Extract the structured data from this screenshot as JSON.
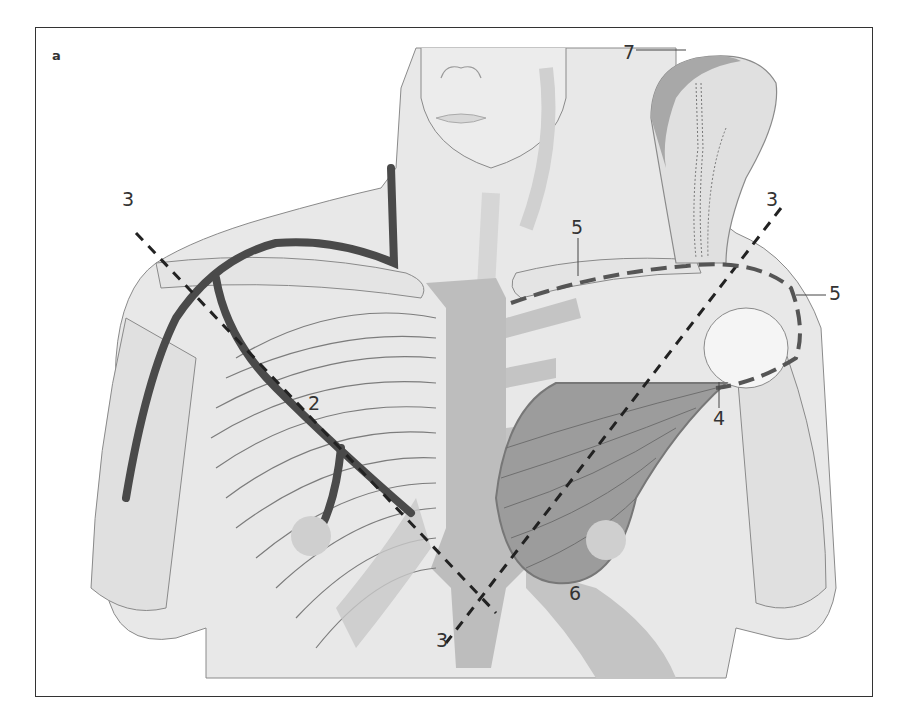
{
  "figure": {
    "panel_letter": "a",
    "colors": {
      "skin": "#e6e6e6",
      "skin_shadow": "#d2d2d2",
      "sternum_cartilage": "#bdbdbd",
      "muscle_flap": "#9c9c9c",
      "vessel": "#4a4a4a",
      "dashed_line": "#222222",
      "outline": "#8a8a8a",
      "label": "#333333"
    },
    "labels": [
      {
        "id": "label-2",
        "text": "2"
      },
      {
        "id": "label-3-upper-left",
        "text": "3"
      },
      {
        "id": "label-3-upper-right",
        "text": "3"
      },
      {
        "id": "label-3-bottom",
        "text": "3"
      },
      {
        "id": "label-4",
        "text": "4"
      },
      {
        "id": "label-5-clavicle",
        "text": "5"
      },
      {
        "id": "label-5-shoulder",
        "text": "5"
      },
      {
        "id": "label-6",
        "text": "6"
      },
      {
        "id": "label-7",
        "text": "7"
      }
    ]
  }
}
